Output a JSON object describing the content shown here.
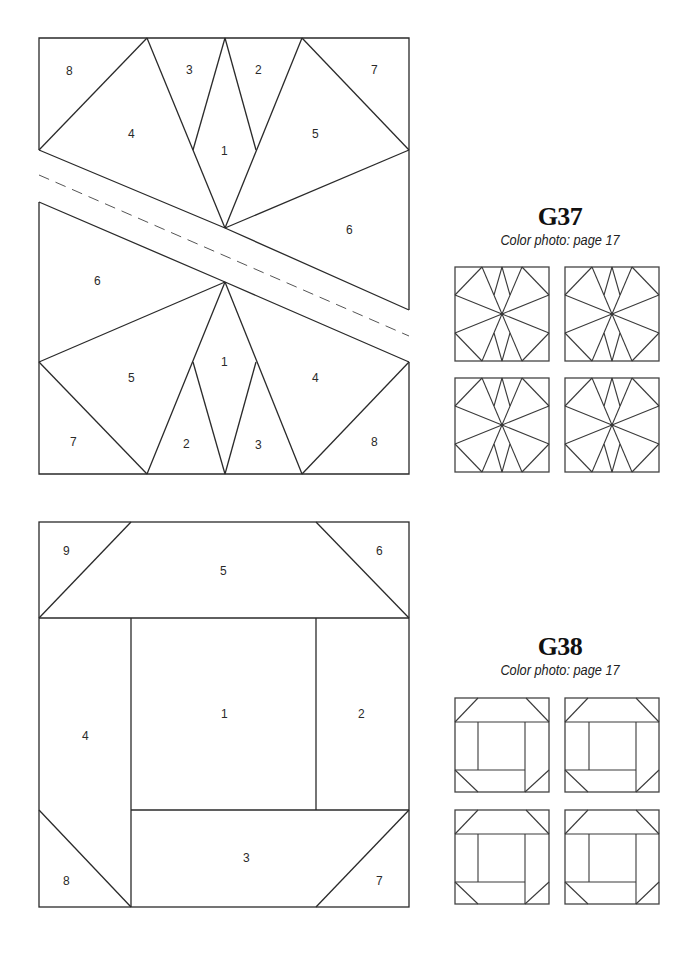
{
  "blocks": [
    {
      "code": "G37",
      "caption": "Color photo: page 17",
      "pattern": {
        "top_section_labels": [
          "1",
          "2",
          "3",
          "4",
          "5",
          "6",
          "7",
          "8"
        ],
        "bottom_section_labels": [
          "1",
          "2",
          "3",
          "4",
          "5",
          "6",
          "7",
          "8"
        ],
        "labels": {
          "top_8": "8",
          "top_3": "3",
          "top_2": "2",
          "top_7": "7",
          "top_4": "4",
          "top_1": "1",
          "top_5": "5",
          "top_6": "6",
          "bottom_6": "6",
          "bottom_1": "1",
          "bottom_5": "5",
          "bottom_4": "4",
          "bottom_7": "7",
          "bottom_2": "2",
          "bottom_3": "3",
          "bottom_8": "8"
        },
        "has_dashed_seam_line": true
      },
      "thumbnails": {
        "count": 4,
        "layout": "2x2"
      }
    },
    {
      "code": "G38",
      "caption": "Color photo: page 17",
      "pattern": {
        "labels": {
          "piece_9": "9",
          "piece_5": "5",
          "piece_6": "6",
          "piece_4": "4",
          "piece_1": "1",
          "piece_2": "2",
          "piece_8": "8",
          "piece_3": "3",
          "piece_7": "7"
        }
      },
      "thumbnails": {
        "count": 4,
        "layout": "2x2"
      }
    }
  ]
}
